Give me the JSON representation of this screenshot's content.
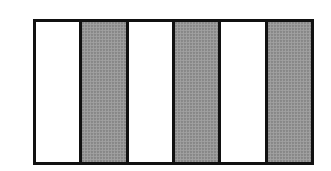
{
  "figure": {
    "total_parts": 6,
    "shaded_parts": 3,
    "shaded_fraction": "3/6",
    "pattern": [
      "white",
      "shaded",
      "white",
      "shaded",
      "white",
      "shaded"
    ],
    "colors": {
      "outline": "#111111",
      "shaded": "#9a9a9a",
      "unshaded": "#ffffff"
    }
  }
}
